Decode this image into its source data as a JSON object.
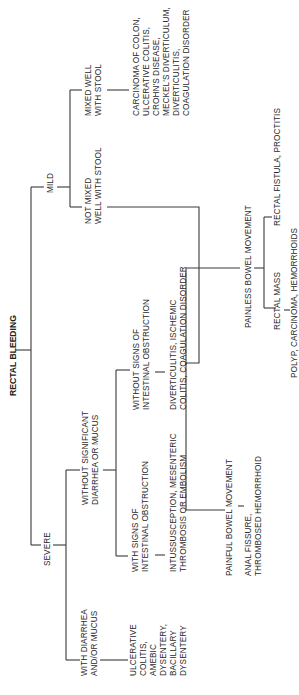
{
  "diagram": {
    "title": "RECTAL BLEEDING",
    "orientation": "rotated-90-ccw",
    "nodes": {
      "root": {
        "label": "RECTAL BLEEDING"
      },
      "mild": {
        "label": "MILD"
      },
      "severe": {
        "label": "SEVERE"
      },
      "mixed_well": {
        "lines": [
          "MIXED WELL",
          "WITH STOOL"
        ]
      },
      "not_mixed": {
        "lines": [
          "NOT MIXED",
          "WELL WITH STOOL"
        ]
      },
      "mixed_causes": {
        "lines": [
          "CARCINOMA OF COLON,",
          "ULCERATIVE COLITIS,",
          "CROHN'S DISEASE,",
          "MECKEL'S DIVERTICULUM,",
          "DIVERTICULITIS,",
          "COAGULATION DISORDER"
        ]
      },
      "painless": {
        "label": "PAINLESS BOWEL MOVEMENT"
      },
      "painful": {
        "label": "PAINFUL BOWEL MOVEMENT"
      },
      "rectal_fistula": {
        "label": "RECTAL FISTULA, PROCTITIS"
      },
      "rectal_mass": {
        "label": "RECTAL MASS"
      },
      "mass_causes": {
        "label": "POLYP, CARCINOMA, HEMORRHOIDS"
      },
      "painful_causes": {
        "lines": [
          "ANAL FISSURE,",
          "THROMBOSED HEMORRHOID"
        ]
      },
      "without_diarrhea": {
        "lines": [
          "WITHOUT SIGNIFICANT",
          "DIARRHEA OR MUCUS"
        ]
      },
      "with_diarrhea": {
        "lines": [
          "WITH DIARRHEA",
          "AND/OR MUCUS"
        ]
      },
      "diarrhea_causes": {
        "lines": [
          "ULCERATIVE",
          "COLITIS,",
          "AMEBIC",
          "DYSENTERY,",
          "BACILLARY",
          "DYSENTERY"
        ]
      },
      "without_obstruction": {
        "lines": [
          "WITHOUT SIGNS OF",
          "INTESTINAL OBSTRUCTION"
        ]
      },
      "with_obstruction": {
        "lines": [
          "WITH SIGNS OF",
          "INTESTINAL OBSTRUCTION"
        ]
      },
      "without_obstruction_causes": {
        "lines": [
          "DIVERTICULITIS, ISCHEMIC",
          "COLITIS, COAGULATION DISORDER"
        ]
      },
      "with_obstruction_causes": {
        "lines": [
          "INTUSSUSCEPTION, MESENTERIC",
          "THROMBOSIS OR EMBOLISM"
        ]
      }
    },
    "edges": [
      [
        "root",
        "mild"
      ],
      [
        "root",
        "severe"
      ],
      [
        "mild",
        "mixed_well"
      ],
      [
        "mild",
        "not_mixed"
      ],
      [
        "mixed_well",
        "mixed_causes"
      ],
      [
        "not_mixed",
        "painless"
      ],
      [
        "not_mixed",
        "painful"
      ],
      [
        "painless",
        "rectal_fistula"
      ],
      [
        "painless",
        "rectal_mass"
      ],
      [
        "rectal_mass",
        "mass_causes"
      ],
      [
        "painful",
        "painful_causes"
      ],
      [
        "severe",
        "without_diarrhea"
      ],
      [
        "severe",
        "with_diarrhea"
      ],
      [
        "with_diarrhea",
        "diarrhea_causes"
      ],
      [
        "without_diarrhea",
        "without_obstruction"
      ],
      [
        "without_diarrhea",
        "with_obstruction"
      ],
      [
        "without_obstruction",
        "without_obstruction_causes"
      ],
      [
        "with_obstruction",
        "with_obstruction_causes"
      ]
    ]
  }
}
